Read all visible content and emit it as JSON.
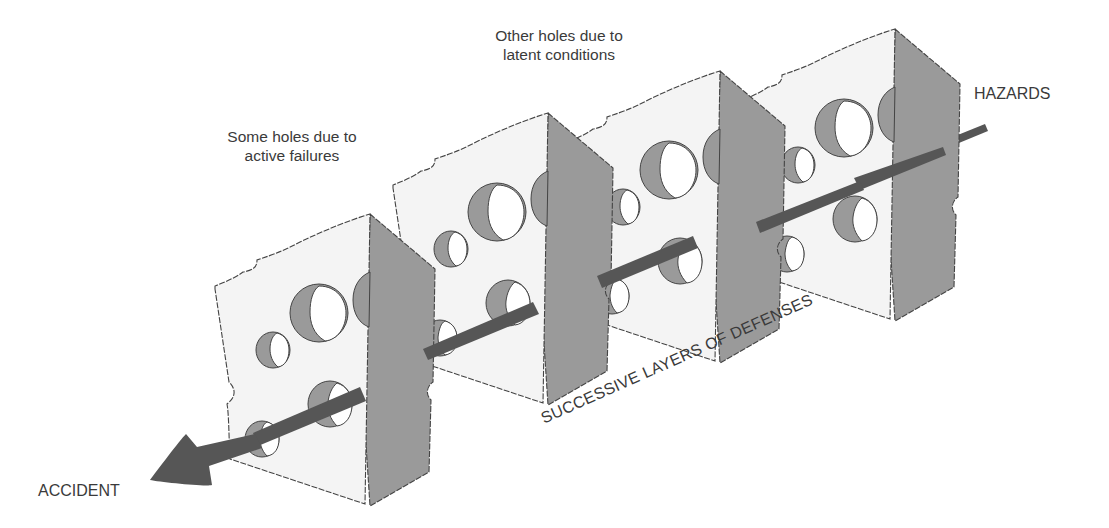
{
  "diagram": {
    "labels": {
      "active_failures_line1": "Some holes due to",
      "active_failures_line2": "active failures",
      "latent_conditions_line1": "Other holes due to",
      "latent_conditions_line2": "latent conditions",
      "hazards": "HAZARDS",
      "accident": "ACCIDENT",
      "layers": "SUCCESSIVE LAYERS OF DEFENSES"
    },
    "layers_count": 4,
    "colors": {
      "background": "#ffffff",
      "slice_face": "#f4f4f4",
      "slice_side": "#9a9a9a",
      "arrow": "#565656",
      "text": "#3a3a3a",
      "outline": "#444444"
    }
  }
}
